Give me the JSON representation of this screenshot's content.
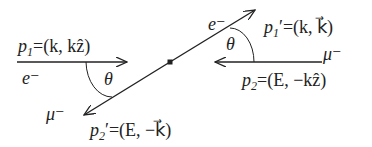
{
  "diagram": {
    "colors": {
      "line": "#222222",
      "background": "#ffffff"
    },
    "incoming_electron": {
      "particle": "e⁻",
      "momentum_symbol": "p",
      "momentum_sub": "1",
      "momentum_value": "=(k, kẑ)"
    },
    "incoming_muon": {
      "particle": "μ⁻",
      "momentum_symbol": "p",
      "momentum_sub": "2",
      "momentum_value": "=(E, −kẑ)"
    },
    "outgoing_electron": {
      "particle": "e⁻",
      "momentum_symbol": "p",
      "momentum_sub": "1",
      "prime": "′",
      "momentum_value": "=(k, k⃗)"
    },
    "outgoing_muon": {
      "particle": "μ⁻",
      "momentum_symbol": "p",
      "momentum_sub": "2",
      "prime": "′",
      "momentum_value": "=(E, −k⃗)"
    },
    "angle_label_left": "θ",
    "angle_label_right": "θ"
  }
}
